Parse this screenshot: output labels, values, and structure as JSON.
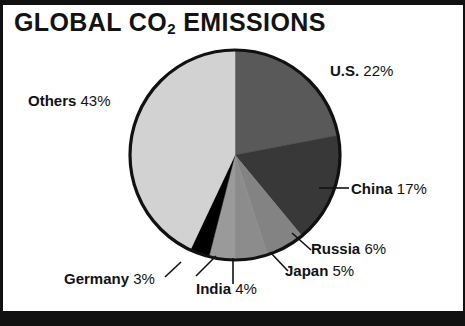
{
  "figure": {
    "title_main": "GLOBAL CO",
    "title_sub": "2",
    "title_tail": " EMISSIONS",
    "title_full": "GLOBAL CO2 EMISSIONS",
    "background": "#ffffff",
    "border_color": "#111111"
  },
  "chart_data": {
    "type": "pie",
    "title": "GLOBAL CO2 EMISSIONS",
    "xlabel": "",
    "ylabel": "",
    "unit": "%",
    "start_angle_deg": 0,
    "direction": "clockwise",
    "legend_position": "outside-labels-with-leader-lines",
    "grid": false,
    "categories": [
      "U.S.",
      "China",
      "Russia",
      "Japan",
      "India",
      "Germany",
      "Others"
    ],
    "values": [
      22,
      17,
      6,
      5,
      4,
      3,
      43
    ],
    "colors": [
      "#595959",
      "#383838",
      "#838383",
      "#8c8c8c",
      "#9a9a9a",
      "#000000",
      "#d2d2d2"
    ],
    "slices": [
      {
        "name": "U.S.",
        "value": 22,
        "label": "U.S. 22%",
        "percent_text": "22%",
        "color": "#595959"
      },
      {
        "name": "China",
        "value": 17,
        "label": "China 17%",
        "percent_text": "17%",
        "color": "#383838"
      },
      {
        "name": "Russia",
        "value": 6,
        "label": "Russia 6%",
        "percent_text": "6%",
        "color": "#838383"
      },
      {
        "name": "Japan",
        "value": 5,
        "label": "Japan 5%",
        "percent_text": "5%",
        "color": "#8c8c8c"
      },
      {
        "name": "India",
        "value": 4,
        "label": "India 4%",
        "percent_text": "4%",
        "color": "#9a9a9a"
      },
      {
        "name": "Germany",
        "value": 3,
        "label": "Germany 3%",
        "percent_text": "3%",
        "color": "#000000"
      },
      {
        "name": "Others",
        "value": 43,
        "label": "Others 43%",
        "percent_text": "43%",
        "color": "#d2d2d2"
      }
    ]
  },
  "labels": {
    "us": {
      "name": "U.S.",
      "pct": "22%"
    },
    "china": {
      "name": "China",
      "pct": "17%"
    },
    "russia": {
      "name": "Russia",
      "pct": "6%"
    },
    "japan": {
      "name": "Japan",
      "pct": "5%"
    },
    "india": {
      "name": "India",
      "pct": "4%"
    },
    "germany": {
      "name": "Germany",
      "pct": "3%"
    },
    "others": {
      "name": "Others",
      "pct": "43%"
    }
  }
}
